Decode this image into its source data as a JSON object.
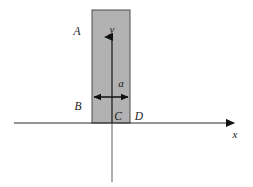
{
  "figure": {
    "name": "rectangular-strip-on-axes",
    "background_color": "#ffffff",
    "slab": {
      "fill_color": "#b2b2b2",
      "stroke_color": "#4d4d4d",
      "x_left": 92,
      "x_right": 130,
      "y_top": 10,
      "y_bottom": 123
    },
    "axes": {
      "line_color": "#2b2b2b",
      "y_axis_below_color": "#9a9a9a",
      "origin_x": 112,
      "origin_y": 123,
      "x_axis_start": 14,
      "x_axis_end": 240,
      "y_axis_top": 30,
      "y_axis_bottom": 182
    },
    "labels": {
      "x_axis": "x",
      "y_axis": "y",
      "corner_a": "A",
      "corner_b": "B",
      "corner_c": "C",
      "corner_d": "D",
      "width_dimension": "a"
    },
    "dimension_arrow": {
      "name": "width-dimension-arrow",
      "y": 97,
      "x_start": 92,
      "x_end": 130,
      "color": "#1a1a1a"
    }
  }
}
